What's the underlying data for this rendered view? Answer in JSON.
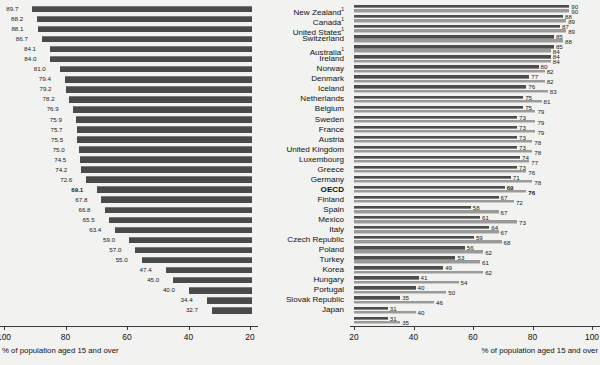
{
  "chart_data": {
    "type": "bar",
    "title": "",
    "orientation": "horizontal",
    "panels": [
      {
        "name": "left",
        "direction": "right-to-left",
        "xlabel": "% of population aged 15 and over",
        "xlim": [
          100,
          20
        ],
        "xticks": [
          100,
          80,
          60,
          40,
          20
        ],
        "grid": false,
        "series": [
          {
            "name": "left-series",
            "color": "#4a4a4a"
          }
        ],
        "categories": [
          "New Zealand",
          "Canada",
          "United States",
          "Switzerland",
          "Australia",
          "Ireland",
          "Norway",
          "Denmark",
          "Iceland",
          "Netherlands",
          "Belgium",
          "Sweden",
          "France",
          "Austria",
          "United Kingdom",
          "Luxembourg",
          "Greece",
          "Germany",
          "OECD",
          "Finland",
          "Spain",
          "Mexico",
          "Italy",
          "Czech Republic",
          "Poland",
          "Turkey",
          "Korea",
          "Hungary",
          "Portugal",
          "Slovak Republic",
          "Japan"
        ],
        "values": [
          89.7,
          88.2,
          88.1,
          86.7,
          84.1,
          84.0,
          81.0,
          79.4,
          79.2,
          78.2,
          76.9,
          75.9,
          75.7,
          75.5,
          75.0,
          74.5,
          74.2,
          72.6,
          69.1,
          67.8,
          66.8,
          65.5,
          63.4,
          59.0,
          57.0,
          55.0,
          47.4,
          45.0,
          40.0,
          34.4,
          32.7
        ],
        "labels": [
          "89.7",
          "88.2",
          "88.1",
          "86.7",
          "84.1",
          "84.0",
          "81.0",
          "79.4",
          "79.2",
          "78.2",
          "76.9",
          "75.9",
          "75.7",
          "75.5",
          "75.0",
          "74.5",
          "74.2",
          "72.6",
          "69.1",
          "67.8",
          "66.8",
          "65.5",
          "63.4",
          "59.0",
          "57.0",
          "55.0",
          "47.4",
          "45.0",
          "40.0",
          "34.4",
          "32.7"
        ]
      },
      {
        "name": "right",
        "direction": "left-to-right",
        "xlabel": "% of population aged 15 and over",
        "xlim": [
          20,
          100
        ],
        "xticks": [
          20,
          40,
          60,
          80,
          100
        ],
        "grid": false,
        "series": [
          {
            "name": "series-a",
            "color": "#4d4d4d",
            "values": [
              90,
              88,
              87,
              85,
              85,
              84,
              80,
              77,
              76,
              75,
              75,
              73,
              73,
              73,
              73,
              74,
              73,
              71,
              69,
              67,
              58,
              61,
              64,
              59,
              56,
              53,
              49,
              41,
              40,
              35,
              31,
              31
            ]
          },
          {
            "name": "series-b",
            "color": "#9a9a9a",
            "values": [
              90,
              89,
              89,
              88,
              84,
              84,
              82,
              82,
              83,
              81,
              79,
              79,
              79,
              78,
              78,
              77,
              76,
              78,
              76,
              72,
              67,
              73,
              67,
              68,
              62,
              61,
              62,
              54,
              50,
              46,
              40,
              35
            ]
          }
        ]
      }
    ],
    "rows": [
      {
        "country": "New Zealand",
        "footnote": "1",
        "bold": false,
        "left": "89.7",
        "left_value": 89.7,
        "right_a": "90",
        "right_a_value": 90,
        "right_b": "90",
        "right_b_value": 90
      },
      {
        "country": "Canada",
        "footnote": "1",
        "bold": false,
        "left": "88.2",
        "left_value": 88.2,
        "right_a": "88",
        "right_a_value": 88,
        "right_b": "89",
        "right_b_value": 89
      },
      {
        "country": "United States",
        "footnote": "1",
        "bold": false,
        "left": "88.1",
        "left_value": 88.1,
        "right_a": "87",
        "right_a_value": 87,
        "right_b": "89",
        "right_b_value": 89
      },
      {
        "country": "Switzerland",
        "footnote": "",
        "bold": false,
        "left": "86.7",
        "left_value": 86.7,
        "right_a": "85",
        "right_a_value": 85,
        "right_b": "88",
        "right_b_value": 88
      },
      {
        "country": "Australia",
        "footnote": "1",
        "bold": false,
        "left": "84.1",
        "left_value": 84.1,
        "right_a": "85",
        "right_a_value": 85,
        "right_b": "84",
        "right_b_value": 84
      },
      {
        "country": "Ireland",
        "footnote": "",
        "bold": false,
        "left": "84.0",
        "left_value": 84.0,
        "right_a": "84",
        "right_a_value": 84,
        "right_b": "84",
        "right_b_value": 84
      },
      {
        "country": "Norway",
        "footnote": "",
        "bold": false,
        "left": "81.0",
        "left_value": 81.0,
        "right_a": "80",
        "right_a_value": 80,
        "right_b": "82",
        "right_b_value": 82
      },
      {
        "country": "Denmark",
        "footnote": "",
        "bold": false,
        "left": "79.4",
        "left_value": 79.4,
        "right_a": "77",
        "right_a_value": 77,
        "right_b": "82",
        "right_b_value": 82
      },
      {
        "country": "Iceland",
        "footnote": "",
        "bold": false,
        "left": "79.2",
        "left_value": 79.2,
        "right_a": "76",
        "right_a_value": 76,
        "right_b": "83",
        "right_b_value": 83
      },
      {
        "country": "Netherlands",
        "footnote": "",
        "bold": false,
        "left": "78.2",
        "left_value": 78.2,
        "right_a": "75",
        "right_a_value": 75,
        "right_b": "81",
        "right_b_value": 81
      },
      {
        "country": "Belgium",
        "footnote": "",
        "bold": false,
        "left": "76.9",
        "left_value": 76.9,
        "right_a": "75",
        "right_a_value": 75,
        "right_b": "79",
        "right_b_value": 79
      },
      {
        "country": "Sweden",
        "footnote": "",
        "bold": false,
        "left": "75.9",
        "left_value": 75.9,
        "right_a": "73",
        "right_a_value": 73,
        "right_b": "79",
        "right_b_value": 79
      },
      {
        "country": "France",
        "footnote": "",
        "bold": false,
        "left": "75.7",
        "left_value": 75.7,
        "right_a": "73",
        "right_a_value": 73,
        "right_b": "79",
        "right_b_value": 79
      },
      {
        "country": "Austria",
        "footnote": "",
        "bold": false,
        "left": "75.5",
        "left_value": 75.5,
        "right_a": "73",
        "right_a_value": 73,
        "right_b": "78",
        "right_b_value": 78
      },
      {
        "country": "United Kingdom",
        "footnote": "",
        "bold": false,
        "left": "75.0",
        "left_value": 75.0,
        "right_a": "73",
        "right_a_value": 73,
        "right_b": "78",
        "right_b_value": 78
      },
      {
        "country": "Luxembourg",
        "footnote": "",
        "bold": false,
        "left": "74.5",
        "left_value": 74.5,
        "right_a": "74",
        "right_a_value": 74,
        "right_b": "77",
        "right_b_value": 77
      },
      {
        "country": "Greece",
        "footnote": "",
        "bold": false,
        "left": "74.2",
        "left_value": 74.2,
        "right_a": "73",
        "right_a_value": 73,
        "right_b": "76",
        "right_b_value": 76
      },
      {
        "country": "Germany",
        "footnote": "",
        "bold": false,
        "left": "72.6",
        "left_value": 72.6,
        "right_a": "71",
        "right_a_value": 71,
        "right_b": "78",
        "right_b_value": 78
      },
      {
        "country": "OECD",
        "footnote": "",
        "bold": true,
        "left": "69.1",
        "left_value": 69.1,
        "right_a": "69",
        "right_a_value": 69,
        "right_b": "76",
        "right_b_value": 76
      },
      {
        "country": "Finland",
        "footnote": "",
        "bold": false,
        "left": "67.8",
        "left_value": 67.8,
        "right_a": "67",
        "right_a_value": 67,
        "right_b": "72",
        "right_b_value": 72
      },
      {
        "country": "Spain",
        "footnote": "",
        "bold": false,
        "left": "66.8",
        "left_value": 66.8,
        "right_a": "58",
        "right_a_value": 58,
        "right_b": "67",
        "right_b_value": 67
      },
      {
        "country": "Mexico",
        "footnote": "",
        "bold": false,
        "left": "65.5",
        "left_value": 65.5,
        "right_a": "61",
        "right_a_value": 61,
        "right_b": "73",
        "right_b_value": 73
      },
      {
        "country": "Italy",
        "footnote": "",
        "bold": false,
        "left": "63.4",
        "left_value": 63.4,
        "right_a": "64",
        "right_a_value": 64,
        "right_b": "67",
        "right_b_value": 67
      },
      {
        "country": "Czech Republic",
        "footnote": "",
        "bold": false,
        "left": "59.0",
        "left_value": 59.0,
        "right_a": "59",
        "right_a_value": 59,
        "right_b": "68",
        "right_b_value": 68
      },
      {
        "country": "Poland",
        "footnote": "",
        "bold": false,
        "left": "57.0",
        "left_value": 57.0,
        "right_a": "56",
        "right_a_value": 56,
        "right_b": "62",
        "right_b_value": 62
      },
      {
        "country": "Turkey",
        "footnote": "",
        "bold": false,
        "left": "55.0",
        "left_value": 55.0,
        "right_a": "53",
        "right_a_value": 53,
        "right_b": "61",
        "right_b_value": 61
      },
      {
        "country": "Korea",
        "footnote": "",
        "bold": false,
        "left": "47.4",
        "left_value": 47.4,
        "right_a": "49",
        "right_a_value": 49,
        "right_b": "62",
        "right_b_value": 62
      },
      {
        "country": "Hungary",
        "footnote": "",
        "bold": false,
        "left": "45.0",
        "left_value": 45.0,
        "right_a": "41",
        "right_a_value": 41,
        "right_b": "54",
        "right_b_value": 54
      },
      {
        "country": "Portugal",
        "footnote": "",
        "bold": false,
        "left": "40.0",
        "left_value": 40.0,
        "right_a": "40",
        "right_a_value": 40,
        "right_b": "50",
        "right_b_value": 50
      },
      {
        "country": "Slovak Republic",
        "footnote": "",
        "bold": false,
        "left": "34.4",
        "left_value": 34.4,
        "right_a": "35",
        "right_a_value": 35,
        "right_b": "46",
        "right_b_value": 46
      },
      {
        "country": "Japan",
        "footnote": "",
        "bold": false,
        "left": "32.7",
        "left_value": 32.7,
        "right_a": "31",
        "right_a_value": 31,
        "right_b": "40",
        "right_b_value": 40
      },
      {
        "country": "",
        "footnote": "",
        "bold": false,
        "left": "",
        "left_value": null,
        "right_a": "31",
        "right_a_value": 31,
        "right_b": "35",
        "right_b_value": 35
      }
    ]
  },
  "left_axis": {
    "caption": "% of population aged 15 and over",
    "ticks": [
      "100",
      "80",
      "60",
      "40",
      "20"
    ]
  },
  "right_axis": {
    "caption": "% of population aged 15 and over",
    "ticks": [
      "20",
      "40",
      "60",
      "80",
      "100"
    ]
  }
}
